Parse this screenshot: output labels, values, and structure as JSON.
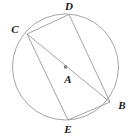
{
  "figure": {
    "type": "circle-geometry-diagram",
    "width": 135,
    "height": 136,
    "background_color": "#ffffff",
    "stroke_color": "#9a9a9a",
    "stroke_width": 0.9,
    "label_color": "#1a1a1a",
    "center_marker_color": "#808080"
  },
  "circle": {
    "center_label": "A",
    "cx": 65.5,
    "cy": 67,
    "r": 53
  },
  "points": [
    {
      "label": "C",
      "x": 27,
      "y": 34,
      "label_x": 15,
      "label_y": 29
    },
    {
      "label": "D",
      "x": 69,
      "y": 14.5,
      "label_x": 69,
      "label_y": 6
    },
    {
      "label": "B",
      "x": 110,
      "y": 102,
      "label_x": 122,
      "label_y": 105
    },
    {
      "label": "E",
      "x": 68,
      "y": 120,
      "label_x": 68,
      "label_y": 129
    },
    {
      "label": "A",
      "x": 65.5,
      "y": 67,
      "label_x": 68,
      "label_y": 79
    }
  ],
  "segments": [
    {
      "name": "C-D",
      "from": "C",
      "to": "D",
      "x1": 27,
      "y1": 34,
      "x2": 69,
      "y2": 14.5
    },
    {
      "name": "D-B",
      "from": "D",
      "to": "B",
      "x1": 69,
      "y1": 14.5,
      "x2": 110,
      "y2": 102
    },
    {
      "name": "C-B",
      "from": "C",
      "to": "B",
      "x1": 27,
      "y1": 34,
      "x2": 110,
      "y2": 102
    },
    {
      "name": "C-E",
      "from": "C",
      "to": "E",
      "x1": 27,
      "y1": 34,
      "x2": 68,
      "y2": 120
    },
    {
      "name": "E-B",
      "from": "E",
      "to": "B",
      "x1": 68,
      "y1": 120,
      "x2": 110,
      "y2": 102
    }
  ],
  "center_marker": {
    "x": 65.5,
    "y": 67,
    "size": 3
  }
}
